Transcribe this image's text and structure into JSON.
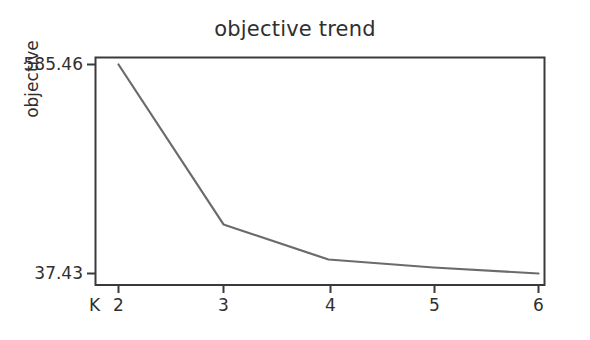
{
  "chart_data": {
    "type": "line",
    "title": "objective trend",
    "xlabel": "K",
    "ylabel": "objective",
    "x": [
      2,
      3,
      4,
      5,
      6
    ],
    "xtick_labels": [
      "2",
      "3",
      "4",
      "5",
      "6"
    ],
    "values": [
      585.46,
      166.0,
      74.1,
      53.1,
      37.43
    ],
    "ytick_labels": [
      "585.46",
      "37.43"
    ],
    "ytick_values": [
      585.46,
      37.43
    ],
    "ylim": [
      37.43,
      585.46
    ],
    "xlim": [
      1.78,
      6.22
    ],
    "grid": false,
    "legend": false,
    "series": [
      {
        "name": "objective",
        "values": [
          585.46,
          166.0,
          74.1,
          53.1,
          37.43
        ],
        "color": "#6b6b6b"
      }
    ],
    "line_color": "#6b6b6b",
    "frame_color": "#3a3a3a",
    "background_color": "#ffffff",
    "text_color": "#2f2f2f"
  },
  "figure": {
    "title": "objective trend",
    "y_axis_title": "objective",
    "x_axis_name": "K",
    "y_ticks": [
      "585.46",
      "37.43"
    ],
    "x_ticks": [
      "2",
      "3",
      "4",
      "5",
      "6"
    ]
  }
}
